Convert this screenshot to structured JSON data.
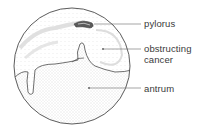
{
  "diagram": {
    "labels": [
      {
        "id": "pylorus",
        "text": "pylorus"
      },
      {
        "id": "obstructing-cancer",
        "line1": "obstructing",
        "line2": "cancer"
      },
      {
        "id": "antrum",
        "text": "antrum"
      }
    ],
    "colors": {
      "outline": "#4a4a4a",
      "stipple": "#c8c8c8",
      "leader": "#6a6a6a",
      "text": "#3a3a3a"
    }
  }
}
